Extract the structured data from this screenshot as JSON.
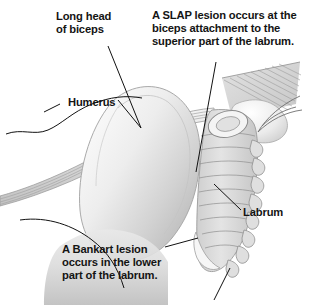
{
  "figure": {
    "background_color": "#ffffff",
    "text_color": "#141414",
    "palette": {
      "bone_light": "#f2f2f2",
      "bone_mid": "#d9d9d9",
      "bone_shadow": "#b5b5b5",
      "cartilage": "#e6e6e6",
      "tendon": "#cfcfcf",
      "outline": "#6e6e6e",
      "leader_line": "#111111"
    }
  },
  "annotations": [
    {
      "id": "long-head-of-biceps",
      "lines": [
        "Long head",
        "of biceps"
      ],
      "text": "Long head\nof biceps",
      "leader": "from label down-right to the biceps tendon bands"
    },
    {
      "id": "slap-lesion",
      "lines": [
        "A SLAP lesion occurs at the",
        "biceps attachment to the",
        "superior part of the labrum."
      ],
      "text": "A SLAP lesion occurs at the\nbiceps attachment to the\nsuperior part of the labrum.",
      "leader": "from text block down to superior labrum"
    },
    {
      "id": "humerus",
      "lines": [
        "Humerus"
      ],
      "text": "Humerus",
      "leader": "contour leaders on both sides of the label"
    },
    {
      "id": "labrum",
      "lines": [
        "Labrum"
      ],
      "text": "Labrum",
      "leader": "from label up-left to the labral rim"
    },
    {
      "id": "bankart-lesion",
      "lines": [
        "A Bankart lesion",
        "occurs in the lower",
        "part of the labrum."
      ],
      "text": "A Bankart lesion\noccurs in the lower\npart of the labrum.",
      "leader": "from first line up-right to the inferior labrum"
    }
  ],
  "anatomy_parts": [
    "long head of biceps tendon",
    "humeral head",
    "humerus shaft",
    "glenoid labrum",
    "superior labrum (SLAP site)",
    "inferior labrum (Bankart site)",
    "glenohumeral capsule",
    "supraspinatus fan"
  ]
}
